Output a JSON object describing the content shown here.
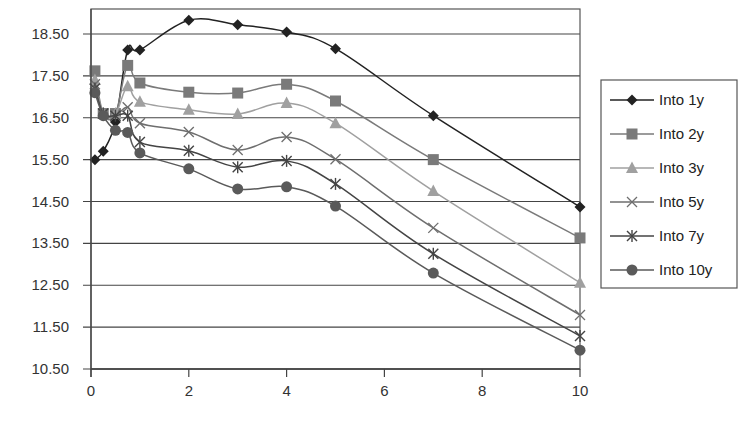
{
  "chart_data": {
    "type": "line",
    "title": "",
    "xlabel": "",
    "ylabel": "",
    "xlim": [
      0,
      10
    ],
    "ylim": [
      10.5,
      19.1
    ],
    "x_ticks": [
      0,
      2,
      4,
      6,
      8,
      10
    ],
    "y_ticks": [
      10.5,
      11.5,
      12.5,
      13.5,
      14.5,
      15.5,
      16.5,
      17.5,
      18.5
    ],
    "y_tick_labels": [
      "10.50",
      "11.50",
      "12.50",
      "13.50",
      "14.50",
      "15.50",
      "16.50",
      "17.50",
      "18.50"
    ],
    "grid": {
      "horizontal": true,
      "vertical": false
    },
    "legend_position": "right",
    "x": [
      0.08,
      0.25,
      0.5,
      0.75,
      1,
      2,
      3,
      4,
      5,
      7,
      10
    ],
    "series": [
      {
        "name": "Into 1y",
        "marker": "diamond",
        "color": "#222222",
        "values": [
          15.5,
          15.7,
          16.4,
          18.12,
          18.12,
          18.83,
          18.72,
          18.55,
          18.15,
          16.55,
          14.37
        ]
      },
      {
        "name": "Into 2y",
        "marker": "square",
        "color": "#7a7a7a",
        "values": [
          17.62,
          16.6,
          16.6,
          17.75,
          17.33,
          17.11,
          17.09,
          17.3,
          16.9,
          15.5,
          13.63
        ]
      },
      {
        "name": "Into 3y",
        "marker": "triangle",
        "color": "#a0a0a0",
        "values": [
          17.4,
          16.6,
          16.6,
          17.25,
          16.88,
          16.69,
          16.59,
          16.85,
          16.37,
          14.75,
          12.56
        ]
      },
      {
        "name": "Into 5y",
        "marker": "x",
        "color": "#6e6e6e",
        "values": [
          17.3,
          16.6,
          16.55,
          16.75,
          16.37,
          16.16,
          15.73,
          16.04,
          15.51,
          13.87,
          11.79
        ]
      },
      {
        "name": "Into 7y",
        "marker": "star",
        "color": "#444444",
        "values": [
          17.2,
          16.6,
          16.55,
          16.55,
          15.92,
          15.71,
          15.32,
          15.47,
          14.92,
          13.25,
          11.29
        ]
      },
      {
        "name": "Into 10y",
        "marker": "circle",
        "color": "#5a5a5a",
        "values": [
          17.1,
          16.55,
          16.2,
          16.15,
          15.66,
          15.28,
          14.8,
          14.85,
          14.39,
          12.79,
          10.95
        ]
      }
    ]
  }
}
